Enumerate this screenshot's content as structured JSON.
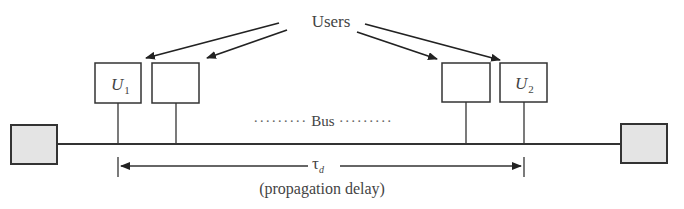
{
  "diagram": {
    "title_label": "Users",
    "bus_label": "Bus",
    "bus_dots_left": "·········",
    "bus_dots_right": "·········",
    "delay_symbol": "τ",
    "delay_subscript": "d",
    "delay_caption": "(propagation delay)",
    "users": [
      {
        "label": "U",
        "subscript": "1"
      },
      {
        "label": "",
        "subscript": ""
      },
      {
        "label": "",
        "subscript": ""
      },
      {
        "label": "U",
        "subscript": "2"
      }
    ],
    "colors": {
      "line": "#333333",
      "terminator_fill": "#e4e4e4",
      "box_fill": "#ffffff"
    }
  }
}
